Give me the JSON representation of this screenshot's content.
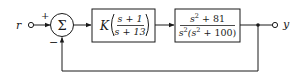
{
  "diagram": {
    "type": "block-diagram",
    "input": {
      "label": "r"
    },
    "output": {
      "label": "y"
    },
    "summing_junction": {
      "symbol": "Σ",
      "plus_sign": "+",
      "minus_sign": "−"
    },
    "blocks": [
      {
        "id": "controller",
        "gain": "K",
        "numerator": "s + 1",
        "denominator": "s + 13"
      },
      {
        "id": "plant",
        "numerator_base": "s",
        "numerator_exp": "2",
        "numerator_rest": " + 81",
        "denominator_base": "s",
        "denominator_exp": "2",
        "denominator_paren_open": "(s",
        "denominator_exp2": "2",
        "denominator_rest": " + 100)"
      }
    ],
    "feedback": "unity negative feedback",
    "colors": {
      "line": "#1a1a1a",
      "box_fill": "#ffffff"
    }
  }
}
